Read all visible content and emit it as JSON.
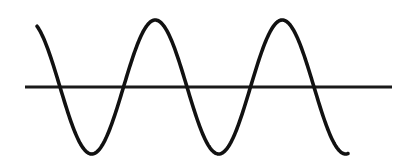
{
  "figure": {
    "title": "",
    "background_color": "#ffffff",
    "width": 410,
    "height": 158
  },
  "chart_data": {
    "type": "line",
    "title": "",
    "subtitle": "",
    "xlabel": "",
    "ylabel": "",
    "grid": false,
    "legend": null,
    "axis_line": {
      "name": "horizontal-axis",
      "orientation": "horizontal",
      "y": 87,
      "x_start": 25,
      "x_end": 392,
      "color": "#1a1a1a",
      "stroke_width": 3
    },
    "series": [
      {
        "name": "sine-wave",
        "color": "#111111",
        "stroke_width": 3.6,
        "baseline_y": 87,
        "amplitude_px": 67,
        "period_px": 127,
        "phase": "descending-at-start",
        "x_start": 37,
        "x_end": 348,
        "y_start": 19,
        "y_end": 147,
        "cycles": 2.45,
        "keypoints": [
          {
            "label": "start",
            "kind": "endpoint",
            "x": 37,
            "y": 19
          },
          {
            "label": "crossing-1",
            "kind": "zero-crossing",
            "x": 60,
            "y": 87
          },
          {
            "label": "trough-1",
            "kind": "minimum",
            "x": 98,
            "y": 149
          },
          {
            "label": "crossing-2",
            "kind": "zero-crossing",
            "x": 128,
            "y": 87
          },
          {
            "label": "peak-1",
            "kind": "maximum",
            "x": 161,
            "y": 15
          },
          {
            "label": "crossing-3",
            "kind": "zero-crossing",
            "x": 195,
            "y": 87
          },
          {
            "label": "trough-2",
            "kind": "minimum",
            "x": 225,
            "y": 148
          },
          {
            "label": "crossing-4",
            "kind": "zero-crossing",
            "x": 258,
            "y": 87
          },
          {
            "label": "peak-2",
            "kind": "maximum",
            "x": 288,
            "y": 14
          },
          {
            "label": "crossing-5",
            "kind": "zero-crossing",
            "x": 325,
            "y": 87
          },
          {
            "label": "end",
            "kind": "endpoint",
            "x": 348,
            "y": 147
          }
        ],
        "path": "M 37,19 C 44,44 50,64 60,87 C 72,114 83,149 98,149 C 113,149 121,117 128,87 C 135,55 146,15 161,15 C 176,15 188,56 195,87 C 202,118 211,148 225,148 C 239,148 250,47 258,87 C 258,87 274,14 288,14 C 303,14 317,57 325,87 C 332,112 341,131 348,147"
      }
    ]
  }
}
